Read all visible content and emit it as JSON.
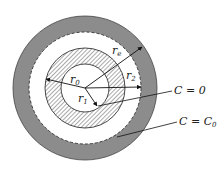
{
  "diagram": {
    "type": "concentric-cylinder-cross-section",
    "colors": {
      "background": "#ffffff",
      "outer_ring": "#8c8c8c",
      "hatch": "#555555",
      "line": "#222222"
    },
    "geometry": {
      "center": [
        85,
        88
      ],
      "outer_radius": 72,
      "dashed_radius": 56,
      "hatched_outer_radius": 40,
      "inner_radius": 24
    },
    "radius_labels": {
      "r0": {
        "main": "r",
        "sub": "0"
      },
      "r1": {
        "main": "r",
        "sub": "1"
      },
      "r2": {
        "main": "r",
        "sub": "2"
      },
      "re": {
        "main": "r",
        "sub": "e"
      }
    },
    "annotations": {
      "c_zero": {
        "text": "C = 0"
      },
      "c_c0": {
        "main": "C = C",
        "sub": "0"
      }
    }
  }
}
